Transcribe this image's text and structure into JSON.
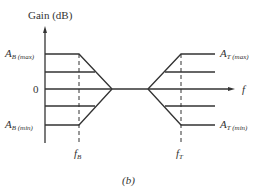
{
  "figure": {
    "y_axis_label": "Gain (dB)",
    "x_axis_label": "f",
    "caption": "(b)",
    "zero_label": "0",
    "left_labels": {
      "max": {
        "main": "A",
        "sub": "B (max)"
      },
      "min": {
        "main": "A",
        "sub": "B (min)"
      }
    },
    "right_labels": {
      "max": {
        "main": "A",
        "sub": "T (max)"
      },
      "min": {
        "main": "A",
        "sub": "T (min)"
      }
    },
    "freq_labels": {
      "bass": {
        "main": "f",
        "sub": "B"
      },
      "treble": {
        "main": "f",
        "sub": "T"
      }
    },
    "line_color": "#333333"
  }
}
